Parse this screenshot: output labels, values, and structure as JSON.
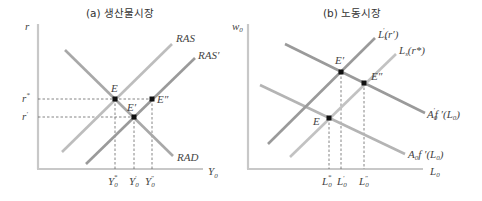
{
  "panels": [
    {
      "title": "(a) 생산물시장",
      "y_axis": {
        "label": "r"
      },
      "x_axis": {
        "label": "Y",
        "label_sub": "0"
      },
      "y_ticks": [
        {
          "label": "r",
          "mark": "*"
        },
        {
          "label": "r",
          "mark": "′"
        }
      ],
      "x_ticks": [
        {
          "label": "Y",
          "sub": "0",
          "mark": "*"
        },
        {
          "label": "Y",
          "sub": "0",
          "mark": "′"
        },
        {
          "label": "Y",
          "sub": "0",
          "mark": "″"
        }
      ],
      "curves": [
        {
          "name": "RAS",
          "label": "RAS",
          "color": "#bdbdbd"
        },
        {
          "name": "RAS-prime",
          "label": "RAS′",
          "color": "#9a9a9a"
        },
        {
          "name": "RAD",
          "label": "RAD",
          "color": "#a8a8a8"
        }
      ],
      "points": [
        {
          "label": "E"
        },
        {
          "label": "E′"
        },
        {
          "label": "E″"
        }
      ]
    },
    {
      "title": "(b) 노동시장",
      "y_axis": {
        "label": "w",
        "label_sub": "0"
      },
      "x_axis": {
        "label": "L",
        "label_sub": "0"
      },
      "x_ticks": [
        {
          "label": "L",
          "sub": "0",
          "mark": "*"
        },
        {
          "label": "L",
          "sub": "0",
          "mark": "′"
        },
        {
          "label": "L",
          "sub": "0",
          "mark": "″"
        }
      ],
      "curves": [
        {
          "name": "labor-supply-shifted",
          "label_main": "L",
          "label_sub": "s",
          "label_prime": "′",
          "label_arg": "(r′)",
          "color": "#9a9a9a"
        },
        {
          "name": "labor-supply",
          "label_main": "L",
          "label_sub": "s",
          "label_arg": "(r*)",
          "color": "#c2c2c2"
        },
        {
          "name": "labor-demand-shifted",
          "label_main": "A",
          "label_sub": "0",
          "label_prime": "′",
          "label_rest": "f ′(L",
          "label_rest_sub": "0",
          "label_close": ")",
          "color": "#9a9a9a"
        },
        {
          "name": "labor-demand",
          "label_main": "A",
          "label_sub": "0",
          "label_rest": "f ′(L",
          "label_rest_sub": "0",
          "label_close": ")",
          "color": "#b4b4b4"
        }
      ],
      "points": [
        {
          "label": "E"
        },
        {
          "label": "E′"
        },
        {
          "label": "E″"
        }
      ]
    }
  ]
}
